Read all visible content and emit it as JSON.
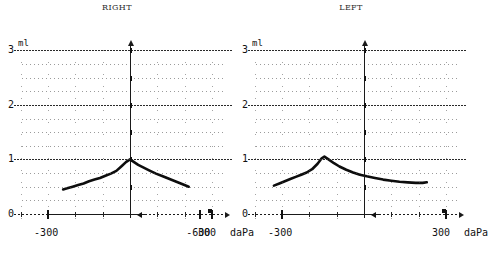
{
  "figure": {
    "kind": "tympanogram",
    "panels": [
      "right",
      "left"
    ]
  },
  "axes": {
    "y_unit": "ml",
    "x_unit": "daPa",
    "y_ticks": [
      "0",
      "1",
      "2",
      "3"
    ],
    "y_tick_values": [
      0,
      1,
      2,
      3
    ],
    "y_range": [
      0,
      3.15
    ],
    "x_ticks": [
      "-600",
      "-300",
      "300"
    ],
    "x_tick_values": [
      -600,
      -300,
      300
    ],
    "x_range": [
      -700,
      360
    ],
    "grid": "dotted"
  },
  "right_panel": {
    "title": "RIGHT",
    "y_unit": "ml",
    "x_unit": "daPa",
    "y_labels": [
      "3",
      "2",
      "1",
      "0"
    ],
    "x_labels": [
      "-600",
      "-300",
      "300"
    ]
  },
  "left_panel": {
    "title": "LEFT",
    "y_unit": "ml",
    "x_unit": "daPa",
    "y_labels": [
      "3",
      "2",
      "1",
      "0"
    ],
    "x_labels": [
      "-600",
      "-300",
      "300"
    ]
  },
  "chart_data": {
    "type": "line",
    "xlabel": "daPa",
    "ylabel": "ml",
    "xlim": [
      -700,
      360
    ],
    "ylim": [
      0,
      3.15
    ],
    "grid": true,
    "legend": "none",
    "panels": [
      {
        "name": "RIGHT",
        "title": "RIGHT",
        "peak_pressure_dapa": 0,
        "peak_compliance_ml": 1.0,
        "x": [
          -245,
          -230,
          -210,
          -190,
          -170,
          -150,
          -130,
          -110,
          -90,
          -70,
          -50,
          -30,
          -15,
          0,
          15,
          30,
          50,
          70,
          95,
          120,
          145,
          170,
          195,
          215
        ],
        "y": [
          0.45,
          0.47,
          0.5,
          0.53,
          0.56,
          0.6,
          0.63,
          0.66,
          0.7,
          0.74,
          0.79,
          0.88,
          0.95,
          1.0,
          0.95,
          0.9,
          0.85,
          0.8,
          0.74,
          0.69,
          0.64,
          0.59,
          0.54,
          0.5
        ]
      },
      {
        "name": "LEFT",
        "title": "LEFT",
        "peak_pressure_dapa": -150,
        "peak_compliance_ml": 1.05,
        "x": [
          -330,
          -310,
          -290,
          -270,
          -250,
          -230,
          -210,
          -190,
          -170,
          -155,
          -145,
          -130,
          -110,
          -90,
          -65,
          -40,
          -15,
          10,
          40,
          70,
          100,
          130,
          160,
          190,
          215,
          230
        ],
        "y": [
          0.52,
          0.56,
          0.6,
          0.64,
          0.68,
          0.72,
          0.76,
          0.82,
          0.92,
          1.02,
          1.05,
          1.0,
          0.93,
          0.87,
          0.81,
          0.76,
          0.72,
          0.69,
          0.66,
          0.63,
          0.61,
          0.59,
          0.58,
          0.57,
          0.57,
          0.58
        ]
      }
    ]
  }
}
